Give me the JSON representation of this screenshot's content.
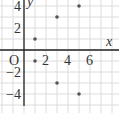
{
  "chart_data": {
    "type": "scatter",
    "title": "",
    "xlabel": "x",
    "ylabel": "y",
    "origin_label": "O",
    "x_ticks": [
      2,
      4,
      6
    ],
    "y_ticks": [
      4,
      2,
      -2,
      -4
    ],
    "x_tick_labels": [
      "2",
      "4",
      "6"
    ],
    "y_tick_labels": [
      "4",
      "2",
      "−2",
      "−4"
    ],
    "xlim": [
      -1,
      8
    ],
    "ylim": [
      -5,
      4.5
    ],
    "grid": true,
    "points": [
      {
        "x": 1,
        "y": 1
      },
      {
        "x": 3,
        "y": 3
      },
      {
        "x": 5,
        "y": 4
      },
      {
        "x": 1,
        "y": -1
      },
      {
        "x": 3,
        "y": -3
      },
      {
        "x": 5,
        "y": -4
      }
    ],
    "colors": {
      "axis": "#222222",
      "grid": "#dcdcdc",
      "point": "#555555"
    }
  }
}
